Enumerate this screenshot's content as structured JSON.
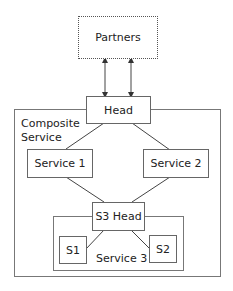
{
  "diagram": {
    "partners": {
      "label": "Partners"
    },
    "composite": {
      "label_line1": "Composite",
      "label_line2": "Service"
    },
    "head": {
      "label": "Head"
    },
    "service1": {
      "label": "Service 1"
    },
    "service2": {
      "label": "Service 2"
    },
    "service3": {
      "label": "Service 3"
    },
    "s3head": {
      "label": "S3 Head"
    },
    "s1": {
      "label": "S1"
    },
    "s2": {
      "label": "S2"
    },
    "edges": [
      {
        "from": "partners",
        "to": "head",
        "type": "bidirectional-arrow"
      },
      {
        "from": "partners",
        "to": "head",
        "type": "bidirectional-arrow"
      },
      {
        "from": "head",
        "to": "service1",
        "type": "line"
      },
      {
        "from": "head",
        "to": "service2",
        "type": "line"
      },
      {
        "from": "service1",
        "to": "s3head",
        "type": "line"
      },
      {
        "from": "service2",
        "to": "s3head",
        "type": "line"
      },
      {
        "from": "s3head",
        "to": "s1",
        "type": "line"
      },
      {
        "from": "s3head",
        "to": "s2",
        "type": "line"
      }
    ]
  }
}
